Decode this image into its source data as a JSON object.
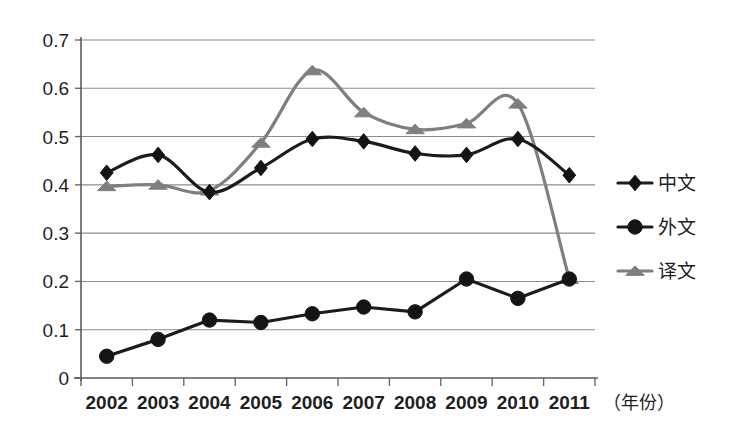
{
  "chart_data": {
    "type": "line",
    "title": "",
    "subtitle": "",
    "xlabel": "（年份）",
    "ylabel": "",
    "categories": [
      "2002",
      "2003",
      "2004",
      "2005",
      "2006",
      "2007",
      "2008",
      "2009",
      "2010",
      "2011"
    ],
    "ylim": [
      0,
      0.7
    ],
    "yticks": [
      "0",
      "0.1",
      "0.2",
      "0.3",
      "0.4",
      "0.5",
      "0.6",
      "0.7"
    ],
    "ytick_values": [
      0,
      0.1,
      0.2,
      0.3,
      0.4,
      0.5,
      0.6,
      0.7
    ],
    "grid": true,
    "grid_axis": "y",
    "legend_position": "right",
    "series": [
      {
        "name": "中文",
        "marker": "diamond",
        "color": "#1c1c1c",
        "values": [
          0.425,
          0.462,
          0.385,
          0.435,
          0.495,
          0.49,
          0.465,
          0.462,
          0.495,
          0.42
        ]
      },
      {
        "name": "外文",
        "marker": "circle",
        "color": "#1c1c1c",
        "values": [
          0.045,
          0.08,
          0.12,
          0.115,
          0.133,
          0.147,
          0.137,
          0.205,
          0.165,
          0.205
        ]
      },
      {
        "name": "译文",
        "marker": "triangle",
        "color": "#7f7f7f",
        "values": [
          0.397,
          0.4,
          0.388,
          0.487,
          0.637,
          0.55,
          0.515,
          0.527,
          0.568,
          0.205
        ]
      }
    ],
    "annotations": []
  },
  "legend": {
    "items": [
      {
        "label": "中文"
      },
      {
        "label": "外文"
      },
      {
        "label": "译文"
      }
    ]
  },
  "axes": {
    "y_tick_labels": [
      "0.7",
      "0.6",
      "0.5",
      "0.4",
      "0.3",
      "0.2",
      "0.1",
      "0"
    ],
    "x_tick_labels": [
      "2002",
      "2003",
      "2004",
      "2005",
      "2006",
      "2007",
      "2008",
      "2009",
      "2010",
      "2011"
    ],
    "x_unit_label": "（年份）"
  },
  "colors": {
    "series_dark": "#1c1c1c",
    "series_gray": "#7f7f7f",
    "gridline": "#8c8c8c",
    "axis": "#5c5c5c",
    "background": "#ffffff"
  }
}
